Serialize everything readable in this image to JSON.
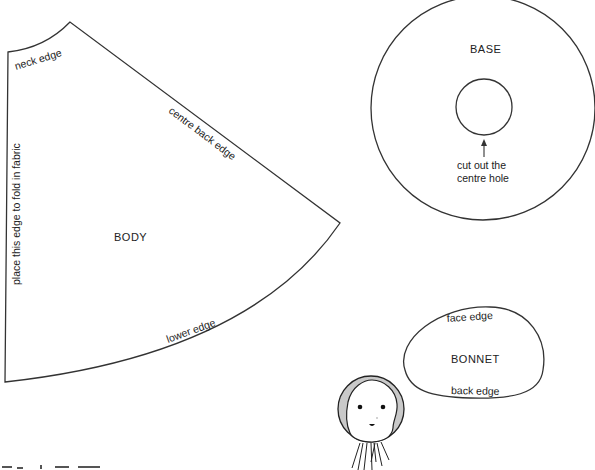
{
  "diagram": {
    "type": "sewing-pattern",
    "pieces": {
      "body": {
        "title": "BODY",
        "neck_label": "neck edge",
        "centre_back_label": "centre back edge",
        "fold_label": "place this edge to fold in fabric",
        "lower_label": "lower edge"
      },
      "base": {
        "title": "BASE",
        "instruction_line1": "cut out the",
        "instruction_line2": "centre hole"
      },
      "bonnet": {
        "title": "BONNET",
        "face_label": "face edge",
        "back_label": "back edge"
      }
    },
    "illustration": {
      "name": "doll-head-with-bonnet",
      "bonnet_color": "#c9c9c9",
      "line_color": "#222222"
    },
    "colors": {
      "background": "#ffffff",
      "outline": "#333333"
    }
  }
}
